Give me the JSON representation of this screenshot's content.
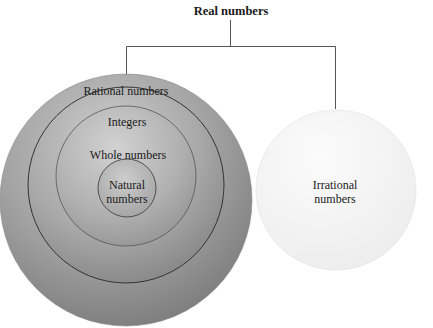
{
  "title": "Real numbers",
  "left_set": {
    "rings": [
      {
        "label": "Rational numbers"
      },
      {
        "label": "Integers"
      },
      {
        "label": "Whole numbers"
      },
      {
        "label_line1": "Natural",
        "label_line2": "numbers"
      }
    ]
  },
  "right_set": {
    "label_line1": "Irrational",
    "label_line2": "numbers"
  },
  "colors": {
    "line": "#555555",
    "ring_outline": "#333333",
    "rational_fill": "#8e8e8e",
    "irrational_fill": "#f2f2f2",
    "text": "#1a1a1a"
  }
}
